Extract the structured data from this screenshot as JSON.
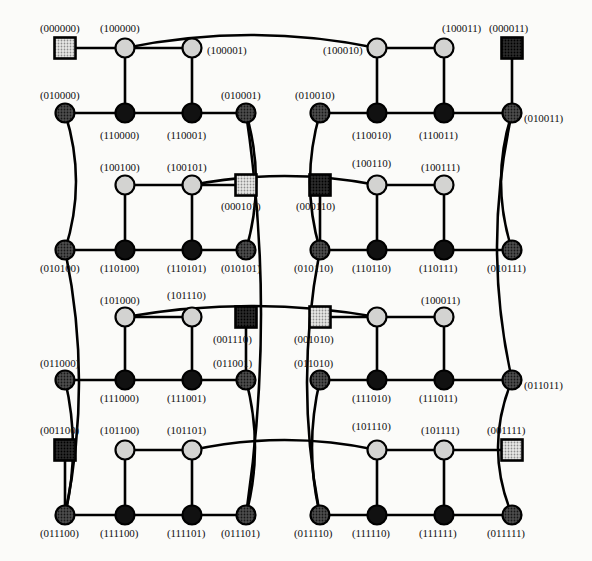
{
  "figure": {
    "kind": "graph-diagram",
    "width": 592,
    "height": 561,
    "background_color": "#fbfbf9",
    "edge_color": "#000000",
    "edge_width": 2.6
  },
  "node_styles": {
    "light_circle": {
      "shape": "circle",
      "fill": "#cfcfcf",
      "stroke": "#000000",
      "radius": 9.5
    },
    "dark_circle": {
      "shape": "circle",
      "fill": "#111111",
      "stroke": "#000000",
      "radius": 9.5
    },
    "mid_circle": {
      "shape": "circle",
      "fill": "#4a4a4a",
      "stroke": "#000000",
      "radius": 9.5
    },
    "light_square": {
      "shape": "square",
      "fill": "#cfcfcf",
      "stroke": "#000000",
      "size": 21
    },
    "dark_square": {
      "shape": "square",
      "fill": "#3a3a3a",
      "stroke": "#000000",
      "size": 21
    }
  },
  "nodes": [
    {
      "id": "000000",
      "label": "(000000)",
      "x": 65,
      "y": 48,
      "style": "light_square",
      "lx": 40,
      "ly": 22
    },
    {
      "id": "100000",
      "label": "(100000)",
      "x": 125,
      "y": 48,
      "style": "light_circle",
      "lx": 100,
      "ly": 22
    },
    {
      "id": "100001",
      "label": "(100001)",
      "x": 192,
      "y": 48,
      "style": "light_circle",
      "lx": 207,
      "ly": 44
    },
    {
      "id": "100010",
      "label": "(100010)",
      "x": 377,
      "y": 48,
      "style": "light_circle",
      "lx": 323,
      "ly": 44
    },
    {
      "id": "100011",
      "label": "(100011)",
      "x": 444,
      "y": 48,
      "style": "light_circle",
      "lx": 442,
      "ly": 22
    },
    {
      "id": "000011",
      "label": "(000011)",
      "x": 512,
      "y": 48,
      "style": "dark_square",
      "lx": 489,
      "ly": 22
    },
    {
      "id": "010000",
      "label": "(010000)",
      "x": 65,
      "y": 113,
      "style": "mid_circle",
      "lx": 40,
      "ly": 89
    },
    {
      "id": "110000",
      "label": "(110000)",
      "x": 125,
      "y": 113,
      "style": "dark_circle",
      "lx": 100,
      "ly": 129
    },
    {
      "id": "110001",
      "label": "(110001)",
      "x": 192,
      "y": 113,
      "style": "dark_circle",
      "lx": 167,
      "ly": 129
    },
    {
      "id": "010001",
      "label": "(010001)",
      "x": 246,
      "y": 113,
      "style": "mid_circle",
      "lx": 221,
      "ly": 89
    },
    {
      "id": "010010",
      "label": "(010010)",
      "x": 320,
      "y": 113,
      "style": "mid_circle",
      "lx": 295,
      "ly": 89
    },
    {
      "id": "110010",
      "label": "(110010)",
      "x": 377,
      "y": 113,
      "style": "dark_circle",
      "lx": 352,
      "ly": 129
    },
    {
      "id": "110011",
      "label": "(110011)",
      "x": 444,
      "y": 113,
      "style": "dark_circle",
      "lx": 419,
      "ly": 129
    },
    {
      "id": "010011",
      "label": "(010011)",
      "x": 512,
      "y": 113,
      "style": "mid_circle",
      "lx": 524,
      "ly": 112
    },
    {
      "id": "100100",
      "label": "(100100)",
      "x": 125,
      "y": 185,
      "style": "light_circle",
      "lx": 100,
      "ly": 161
    },
    {
      "id": "100101",
      "label": "(100101)",
      "x": 192,
      "y": 185,
      "style": "light_circle",
      "lx": 167,
      "ly": 161
    },
    {
      "id": "000101",
      "label": "(000101)",
      "x": 246,
      "y": 185,
      "style": "light_square",
      "lx": 221,
      "ly": 200
    },
    {
      "id": "000110",
      "label": "(000110)",
      "x": 320,
      "y": 185,
      "style": "dark_square",
      "lx": 296,
      "ly": 200
    },
    {
      "id": "100110",
      "label": "(100110)",
      "x": 377,
      "y": 185,
      "style": "light_circle",
      "lx": 352,
      "ly": 157
    },
    {
      "id": "100111",
      "label": "(100111)",
      "x": 444,
      "y": 185,
      "style": "light_circle",
      "lx": 421,
      "ly": 161
    },
    {
      "id": "010100",
      "label": "(010100)",
      "x": 65,
      "y": 250,
      "style": "mid_circle",
      "lx": 40,
      "ly": 262
    },
    {
      "id": "110100",
      "label": "(110100)",
      "x": 125,
      "y": 250,
      "style": "dark_circle",
      "lx": 100,
      "ly": 262
    },
    {
      "id": "110101",
      "label": "(110101)",
      "x": 192,
      "y": 250,
      "style": "dark_circle",
      "lx": 167,
      "ly": 262
    },
    {
      "id": "010101",
      "label": "(010101)",
      "x": 246,
      "y": 250,
      "style": "mid_circle",
      "lx": 221,
      "ly": 262
    },
    {
      "id": "010110",
      "label": "(010110)",
      "x": 320,
      "y": 250,
      "style": "mid_circle",
      "lx": 294,
      "ly": 262
    },
    {
      "id": "110110",
      "label": "(110110)",
      "x": 377,
      "y": 250,
      "style": "dark_circle",
      "lx": 352,
      "ly": 262
    },
    {
      "id": "110111",
      "label": "(110111)",
      "x": 444,
      "y": 250,
      "style": "dark_circle",
      "lx": 419,
      "ly": 262
    },
    {
      "id": "010111",
      "label": "(010111)",
      "x": 512,
      "y": 250,
      "style": "mid_circle",
      "lx": 487,
      "ly": 262
    },
    {
      "id": "101000",
      "label": "(101000)",
      "x": 125,
      "y": 317,
      "style": "light_circle",
      "lx": 100,
      "ly": 294
    },
    {
      "id": "101110a",
      "label": "(101110)",
      "x": 192,
      "y": 317,
      "style": "light_circle",
      "lx": 167,
      "ly": 289
    },
    {
      "id": "001110",
      "label": "(001110)",
      "x": 246,
      "y": 317,
      "style": "dark_square",
      "lx": 213,
      "ly": 333
    },
    {
      "id": "001010",
      "label": "(001010)",
      "x": 320,
      "y": 317,
      "style": "light_square",
      "lx": 294,
      "ly": 333
    },
    {
      "id": "101010",
      "label": "(101010)",
      "x": 377,
      "y": 317,
      "style": "light_circle",
      "lx": 0,
      "ly": 0,
      "hide_label": true
    },
    {
      "id": "100011b",
      "label": "(100011)",
      "x": 444,
      "y": 317,
      "style": "light_circle",
      "lx": 421,
      "ly": 294
    },
    {
      "id": "011000",
      "label": "(011000)",
      "x": 65,
      "y": 380,
      "style": "mid_circle",
      "lx": 40,
      "ly": 357
    },
    {
      "id": "111000",
      "label": "(111000)",
      "x": 125,
      "y": 380,
      "style": "dark_circle",
      "lx": 100,
      "ly": 392
    },
    {
      "id": "111001",
      "label": "(111001)",
      "x": 192,
      "y": 380,
      "style": "dark_circle",
      "lx": 167,
      "ly": 392
    },
    {
      "id": "011001",
      "label": "(011001)",
      "x": 246,
      "y": 380,
      "style": "mid_circle",
      "lx": 213,
      "ly": 357
    },
    {
      "id": "011010",
      "label": "(011010)",
      "x": 320,
      "y": 380,
      "style": "mid_circle",
      "lx": 294,
      "ly": 357
    },
    {
      "id": "111010",
      "label": "(111010)",
      "x": 377,
      "y": 380,
      "style": "dark_circle",
      "lx": 352,
      "ly": 392
    },
    {
      "id": "111011",
      "label": "(111011)",
      "x": 444,
      "y": 380,
      "style": "dark_circle",
      "lx": 419,
      "ly": 392
    },
    {
      "id": "011011",
      "label": "(011011)",
      "x": 512,
      "y": 380,
      "style": "mid_circle",
      "lx": 524,
      "ly": 379
    },
    {
      "id": "001100",
      "label": "(001100)",
      "x": 65,
      "y": 450,
      "style": "dark_square",
      "lx": 40,
      "ly": 424
    },
    {
      "id": "101100",
      "label": "(101100)",
      "x": 125,
      "y": 450,
      "style": "light_circle",
      "lx": 100,
      "ly": 424
    },
    {
      "id": "101101",
      "label": "(101101)",
      "x": 192,
      "y": 450,
      "style": "light_circle",
      "lx": 167,
      "ly": 424
    },
    {
      "id": "101110b",
      "label": "(101110)",
      "x": 377,
      "y": 450,
      "style": "light_circle",
      "lx": 352,
      "ly": 420
    },
    {
      "id": "101111",
      "label": "(101111)",
      "x": 444,
      "y": 450,
      "style": "light_circle",
      "lx": 421,
      "ly": 424
    },
    {
      "id": "001111",
      "label": "(001111)",
      "x": 512,
      "y": 450,
      "style": "light_square",
      "lx": 487,
      "ly": 424
    },
    {
      "id": "011100",
      "label": "(011100)",
      "x": 65,
      "y": 515,
      "style": "mid_circle",
      "lx": 40,
      "ly": 527
    },
    {
      "id": "111100",
      "label": "(111100)",
      "x": 125,
      "y": 515,
      "style": "dark_circle",
      "lx": 100,
      "ly": 527
    },
    {
      "id": "111101",
      "label": "(111101)",
      "x": 192,
      "y": 515,
      "style": "dark_circle",
      "lx": 167,
      "ly": 527
    },
    {
      "id": "011101",
      "label": "(011101)",
      "x": 246,
      "y": 515,
      "style": "mid_circle",
      "lx": 221,
      "ly": 527
    },
    {
      "id": "011110",
      "label": "(011110)",
      "x": 320,
      "y": 515,
      "style": "mid_circle",
      "lx": 294,
      "ly": 527
    },
    {
      "id": "111110",
      "label": "(111110)",
      "x": 377,
      "y": 515,
      "style": "dark_circle",
      "lx": 352,
      "ly": 527
    },
    {
      "id": "111111",
      "label": "(111111)",
      "x": 444,
      "y": 515,
      "style": "dark_circle",
      "lx": 419,
      "ly": 527
    },
    {
      "id": "011111",
      "label": "(011111)",
      "x": 512,
      "y": 515,
      "style": "mid_circle",
      "lx": 487,
      "ly": 527
    }
  ],
  "edges": [
    {
      "from": "000000",
      "to": "100000",
      "type": "line"
    },
    {
      "from": "100000",
      "to": "100001",
      "type": "line"
    },
    {
      "from": "100000",
      "to": "110000",
      "type": "line"
    },
    {
      "from": "100001",
      "to": "110001",
      "type": "line"
    },
    {
      "from": "100000",
      "to": "100010",
      "type": "curve",
      "bow": -26
    },
    {
      "from": "100010",
      "to": "100011",
      "type": "line"
    },
    {
      "from": "100010",
      "to": "110010",
      "type": "line"
    },
    {
      "from": "100011",
      "to": "110011",
      "type": "line"
    },
    {
      "from": "000011",
      "to": "010011",
      "type": "line"
    },
    {
      "from": "010000",
      "to": "110000",
      "type": "line"
    },
    {
      "from": "110000",
      "to": "110001",
      "type": "line"
    },
    {
      "from": "110001",
      "to": "010001",
      "type": "line"
    },
    {
      "from": "010010",
      "to": "110010",
      "type": "line"
    },
    {
      "from": "110010",
      "to": "110011",
      "type": "line"
    },
    {
      "from": "110011",
      "to": "010011",
      "type": "line"
    },
    {
      "from": "010000",
      "to": "010100",
      "type": "curve",
      "bow": -22
    },
    {
      "from": "010001",
      "to": "010101",
      "type": "curve",
      "bow": -20
    },
    {
      "from": "010010",
      "to": "010110",
      "type": "curve",
      "bow": 20
    },
    {
      "from": "010011",
      "to": "010111",
      "type": "curve",
      "bow": 22
    },
    {
      "from": "100100",
      "to": "100101",
      "type": "line"
    },
    {
      "from": "100101",
      "to": "000101",
      "type": "line"
    },
    {
      "from": "100100",
      "to": "110100",
      "type": "line"
    },
    {
      "from": "100101",
      "to": "110101",
      "type": "line"
    },
    {
      "from": "100101",
      "to": "100110",
      "type": "curve",
      "bow": -18
    },
    {
      "from": "000110",
      "to": "010110",
      "type": "line"
    },
    {
      "from": "100110",
      "to": "100111",
      "type": "line"
    },
    {
      "from": "100110",
      "to": "110110",
      "type": "line"
    },
    {
      "from": "100111",
      "to": "110111",
      "type": "line"
    },
    {
      "from": "010100",
      "to": "110100",
      "type": "line"
    },
    {
      "from": "110100",
      "to": "110101",
      "type": "line"
    },
    {
      "from": "110101",
      "to": "010101",
      "type": "line"
    },
    {
      "from": "010110",
      "to": "110110",
      "type": "line"
    },
    {
      "from": "110110",
      "to": "110111",
      "type": "line"
    },
    {
      "from": "110111",
      "to": "010111",
      "type": "line"
    },
    {
      "from": "101000",
      "to": "101110a",
      "type": "line"
    },
    {
      "from": "101000",
      "to": "111000",
      "type": "line"
    },
    {
      "from": "101110a",
      "to": "111001",
      "type": "line"
    },
    {
      "from": "001110",
      "to": "011001",
      "type": "line"
    },
    {
      "from": "001010",
      "to": "101010",
      "type": "line"
    },
    {
      "from": "101010",
      "to": "100011b",
      "type": "line"
    },
    {
      "from": "101010",
      "to": "111010",
      "type": "line"
    },
    {
      "from": "100011b",
      "to": "111011",
      "type": "line"
    },
    {
      "from": "101000",
      "to": "101010",
      "type": "curve",
      "bow": -22
    },
    {
      "from": "011000",
      "to": "111000",
      "type": "line"
    },
    {
      "from": "111000",
      "to": "111001",
      "type": "line"
    },
    {
      "from": "111001",
      "to": "011001",
      "type": "line"
    },
    {
      "from": "011010",
      "to": "111010",
      "type": "line"
    },
    {
      "from": "111010",
      "to": "111011",
      "type": "line"
    },
    {
      "from": "111011",
      "to": "011011",
      "type": "line"
    },
    {
      "from": "010100",
      "to": "011100",
      "type": "curve",
      "bow": -28
    },
    {
      "from": "011000",
      "to": "011100",
      "type": "curve",
      "bow": -16
    },
    {
      "from": "010001",
      "to": "011101",
      "type": "curve",
      "bow": -30
    },
    {
      "from": "011001",
      "to": "011101",
      "type": "curve",
      "bow": -18
    },
    {
      "from": "010110",
      "to": "011110",
      "type": "curve",
      "bow": 26
    },
    {
      "from": "011010",
      "to": "011110",
      "type": "curve",
      "bow": 16
    },
    {
      "from": "010011",
      "to": "011011",
      "type": "curve",
      "bow": 30
    },
    {
      "from": "011011",
      "to": "011111",
      "type": "curve",
      "bow": 28
    },
    {
      "from": "001100",
      "to": "011100",
      "type": "line"
    },
    {
      "from": "101100",
      "to": "101101",
      "type": "line"
    },
    {
      "from": "101100",
      "to": "111100",
      "type": "line"
    },
    {
      "from": "101101",
      "to": "111101",
      "type": "line"
    },
    {
      "from": "101101",
      "to": "101110b",
      "type": "curve",
      "bow": -20
    },
    {
      "from": "101110b",
      "to": "101111",
      "type": "line"
    },
    {
      "from": "101111",
      "to": "001111",
      "type": "line"
    },
    {
      "from": "101110b",
      "to": "111110",
      "type": "line"
    },
    {
      "from": "101111",
      "to": "111111",
      "type": "line"
    },
    {
      "from": "011100",
      "to": "111100",
      "type": "line"
    },
    {
      "from": "111100",
      "to": "111101",
      "type": "line"
    },
    {
      "from": "111101",
      "to": "011101",
      "type": "line"
    },
    {
      "from": "011110",
      "to": "111110",
      "type": "line"
    },
    {
      "from": "111110",
      "to": "111111",
      "type": "line"
    },
    {
      "from": "111111",
      "to": "011111",
      "type": "line"
    }
  ]
}
